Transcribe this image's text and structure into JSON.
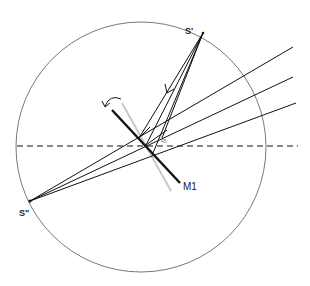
{
  "diagram": {
    "labels": {
      "source_prime": "S'",
      "source_double_prime": "S\"",
      "mirror": "M1",
      "angle": "45"
    },
    "colors": {
      "stroke": "#111111",
      "circle": "#555555",
      "mirror_gray": "#c8c8c8",
      "angle_label": "#777777"
    }
  }
}
